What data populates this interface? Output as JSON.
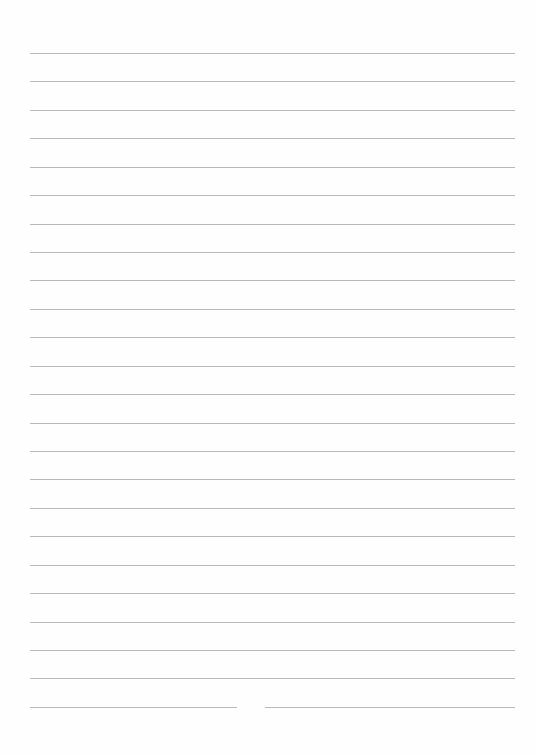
{
  "page": {
    "type": "lined-paper",
    "line_count": 24,
    "first_line_y": 53,
    "line_spacing": 28.43,
    "line_left": 30,
    "line_right": 515,
    "line_color": "#b9b9b9",
    "last_line_gap": {
      "from_x": 237,
      "to_x": 265
    }
  }
}
